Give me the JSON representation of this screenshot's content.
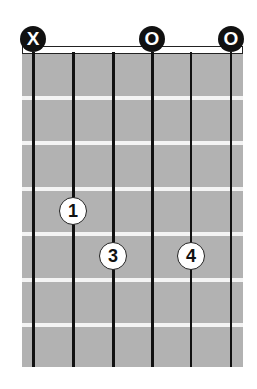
{
  "chord_diagram": {
    "strings": 6,
    "frets_shown": 7,
    "string_markers": [
      {
        "string": 1,
        "label": "X",
        "meaning": "muted"
      },
      {
        "string": 4,
        "label": "O",
        "meaning": "open"
      },
      {
        "string": 6,
        "label": "O",
        "meaning": "open"
      }
    ],
    "fingers": [
      {
        "string": 2,
        "fret": 4,
        "label": "1"
      },
      {
        "string": 3,
        "fret": 5,
        "label": "3"
      },
      {
        "string": 5,
        "fret": 5,
        "label": "4"
      }
    ],
    "colors": {
      "fretboard": "#b2b2b2",
      "fret_line": "#f4f4f4",
      "string": "#111111",
      "marker_bg": "#111111",
      "finger_bg": "#ffffff"
    }
  }
}
